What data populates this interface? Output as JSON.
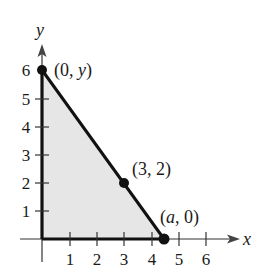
{
  "diagram": {
    "type": "coordinate-plane-triangle",
    "axes": {
      "x_label": "x",
      "y_label": "y",
      "x_ticks": [
        "1",
        "2",
        "3",
        "4",
        "5",
        "6"
      ],
      "y_ticks": [
        "1",
        "2",
        "3",
        "4",
        "5",
        "6"
      ]
    },
    "points": [
      {
        "id": "p-y-intercept",
        "label_open": "(0, ",
        "label_var": "y",
        "label_close": ")",
        "x": 0,
        "y": 6
      },
      {
        "id": "p-mid",
        "label": "(3, 2)",
        "x": 3,
        "y": 2
      },
      {
        "id": "p-x-intercept",
        "label_open": "(",
        "label_var": "a",
        "label_close": ", 0)",
        "x": 4.5,
        "y": 0
      }
    ],
    "region": {
      "description": "Shaded right triangle bounded by the axes and the line through (0, y), (3, 2), (a, 0)",
      "fill_color": "#e6e6e6",
      "edge_color": "#111111"
    }
  }
}
